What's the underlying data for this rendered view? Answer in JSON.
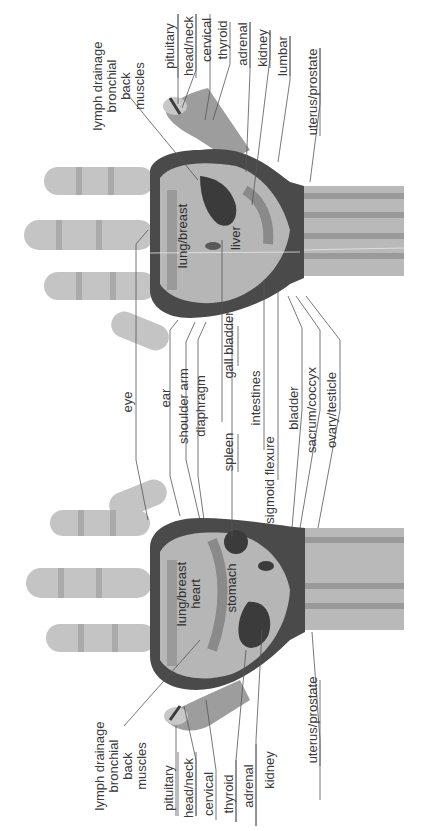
{
  "diagram": {
    "orientation": "rotated 90 degrees counter-clockwise",
    "colors": {
      "background": "#ffffff",
      "skin_light": "#c9c9c9",
      "skin_mid": "#a8a8a8",
      "skin_dark": "#7d7d7d",
      "band_dark": "#4a4a4a",
      "organ_dark": "#3b3b3b",
      "outline": "#2a2a2a",
      "leader_line": "#555555",
      "text": "#3a3a3a"
    }
  },
  "top_hand": {
    "outer_labels": {
      "lymph": [
        "lymph drainage",
        "bronchial",
        "back",
        "muscles"
      ],
      "pituitary": "pituitary",
      "head_neck": "head/neck",
      "cervical": "cervical",
      "thyroid": "thyroid",
      "adrenal": "adrenal",
      "kidney": "kidney",
      "lumbar": "lumbar",
      "uterus_prostate": "uterus/prostate"
    },
    "inner_labels": {
      "lung_breast": "lung/breast",
      "liver": "liver"
    }
  },
  "bottom_hand": {
    "outer_labels": {
      "lymph": [
        "lymph drainage",
        "bronchial",
        "back",
        "muscles"
      ],
      "pituitary": "pituitary",
      "head_neck": "head/neck",
      "cervical": "cervical",
      "thyroid": "thyroid",
      "adrenal": "adrenal",
      "kidney": "kidney",
      "uterus_prostate": "uterus/prostate"
    },
    "inner_labels": {
      "lung_breast": "lung/breast",
      "heart": "heart",
      "stomach": "stomach"
    }
  },
  "shared_labels": {
    "eye": "eye",
    "ear": "ear",
    "shoulder_arm": "shoulder arm",
    "diaphragm": "diaphragm",
    "gall_bladder": "gall bladder",
    "spleen": "spleen",
    "intestines": "intestines",
    "sigmoid_flexure": "sigmoid flexure",
    "bladder": "bladder",
    "sacrum_coccyx": "sacrum/coccyx",
    "ovary_testicle": "ovary/testicle"
  }
}
